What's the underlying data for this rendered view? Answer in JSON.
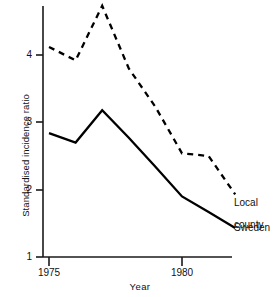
{
  "chart_data": {
    "type": "line",
    "title": "",
    "subtitle": "",
    "xlabel": "Year",
    "ylabel": "Standardised incidence ratio",
    "x": [
      1975,
      1976,
      1977,
      1978,
      1979,
      1980,
      1981,
      1982
    ],
    "xlim": [
      1975,
      1982
    ],
    "ylim": [
      1,
      4.85
    ],
    "xticks": [
      1975,
      1980
    ],
    "xtick_labels": [
      "1975",
      "1980"
    ],
    "yticks": [
      1,
      2,
      3,
      4
    ],
    "ytick_labels": [
      "1",
      "2",
      "3",
      "4"
    ],
    "grid": false,
    "legend_position": "right-inline",
    "series": [
      {
        "name": "Local county",
        "style": "dashed",
        "color": "#000000",
        "values": [
          4.12,
          3.92,
          4.73,
          3.8,
          3.23,
          2.54,
          2.5,
          1.93
        ]
      },
      {
        "name": "Sweden",
        "style": "solid",
        "color": "#000000",
        "values": [
          2.84,
          2.7,
          3.18,
          2.77,
          2.34,
          1.9,
          1.67,
          1.43
        ]
      }
    ],
    "annotations": [
      {
        "text": "Local\ncounty",
        "x": 1982,
        "y": 1.93
      },
      {
        "text": "Sweden",
        "x": 1982,
        "y": 1.43
      }
    ]
  },
  "axes": {
    "y_title": "Standardised incidence ratio",
    "x_title": "Year",
    "y_labels": [
      "4",
      "3",
      "2",
      "1"
    ],
    "x_labels": [
      "1975",
      "1980"
    ]
  },
  "legend": {
    "local_county_line1": "Local",
    "local_county_line2": "county",
    "sweden": "Sweden"
  }
}
